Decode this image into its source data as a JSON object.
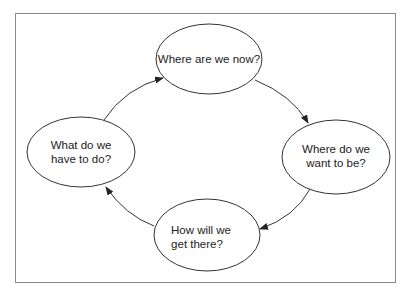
{
  "diagram": {
    "type": "cycle",
    "colors": {
      "stroke": "#333333",
      "frame": "#8a8a8a",
      "background": "#ffffff",
      "text": "#222222"
    },
    "nodes": [
      {
        "id": "now",
        "lines": [
          "Where are we now?"
        ]
      },
      {
        "id": "want",
        "lines": [
          "Where do we",
          "want to be?"
        ]
      },
      {
        "id": "how",
        "lines": [
          "How will we",
          "get there?"
        ]
      },
      {
        "id": "todo",
        "lines": [
          "What do we",
          "have to do?"
        ]
      }
    ],
    "edges": [
      {
        "from": "now",
        "to": "want"
      },
      {
        "from": "want",
        "to": "how"
      },
      {
        "from": "how",
        "to": "todo"
      },
      {
        "from": "todo",
        "to": "now"
      }
    ]
  }
}
